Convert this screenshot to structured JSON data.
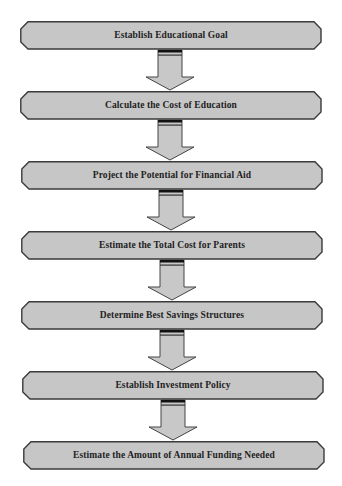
{
  "diagram": {
    "type": "flowchart",
    "colors": {
      "box_fill": "#c6c6c6",
      "box_stroke": "#3a3a3a",
      "arrow_fill": "#c8c8c8",
      "arrow_stroke": "#444444",
      "text": "#222222"
    },
    "steps": [
      {
        "label": "Establish Educational Goal"
      },
      {
        "label": "Calculate the Cost of Education"
      },
      {
        "label": "Project the Potential for Financial Aid"
      },
      {
        "label": "Estimate the Total Cost for Parents"
      },
      {
        "label": "Determine Best Savings Structures"
      },
      {
        "label": "Establish Investment Policy"
      },
      {
        "label": "Estimate the Amount of Annual Funding Needed"
      }
    ],
    "connectors": [
      {
        "from": 0,
        "to": 1,
        "icon": "down-arrow-icon"
      },
      {
        "from": 1,
        "to": 2,
        "icon": "down-arrow-icon"
      },
      {
        "from": 2,
        "to": 3,
        "icon": "down-arrow-icon"
      },
      {
        "from": 3,
        "to": 4,
        "icon": "down-arrow-icon"
      },
      {
        "from": 4,
        "to": 5,
        "icon": "down-arrow-icon"
      },
      {
        "from": 5,
        "to": 6,
        "icon": "down-arrow-icon"
      }
    ]
  }
}
